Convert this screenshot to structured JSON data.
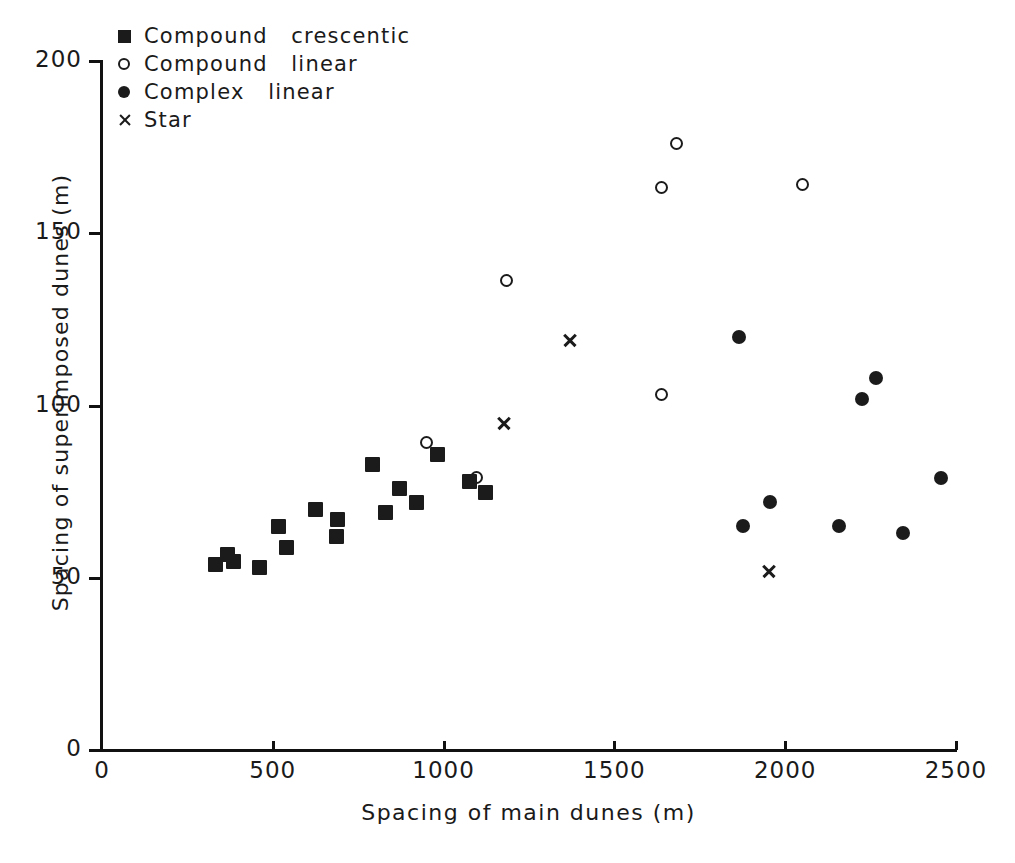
{
  "chart_data": {
    "type": "scatter",
    "title": "",
    "xlabel": "Spacing  of  main  dunes  (m)",
    "ylabel": "Spacing  of  superimposed  dunes  (m)",
    "xlim": [
      0,
      2500
    ],
    "ylim": [
      0,
      200
    ],
    "xticks": [
      0,
      500,
      1000,
      1500,
      2000,
      2500
    ],
    "yticks": [
      0,
      50,
      100,
      150,
      200
    ],
    "xtick_labels": [
      "0",
      "500",
      "1000",
      "1500",
      "2000",
      "2500"
    ],
    "ytick_labels": [
      "0",
      "50",
      "100",
      "150",
      "200"
    ],
    "grid": false,
    "legend_position": "top-left",
    "series": [
      {
        "name": "Compound  crescentic",
        "marker": "filled-square",
        "color": "#1b1b1b",
        "points": [
          [
            331,
            54
          ],
          [
            366,
            57
          ],
          [
            384,
            55
          ],
          [
            460,
            53
          ],
          [
            516,
            65
          ],
          [
            539,
            59
          ],
          [
            624,
            70
          ],
          [
            686,
            62
          ],
          [
            689,
            67
          ],
          [
            791,
            83
          ],
          [
            829,
            69
          ],
          [
            868,
            76
          ],
          [
            920,
            72
          ],
          [
            982,
            86
          ],
          [
            1075,
            78
          ],
          [
            1122,
            75
          ]
        ]
      },
      {
        "name": "Compound  linear",
        "marker": "open-circle",
        "color": "#1b1b1b",
        "points": [
          [
            952,
            89
          ],
          [
            1099,
            79
          ],
          [
            1187,
            136
          ],
          [
            1638,
            163
          ],
          [
            1638,
            103
          ],
          [
            1682,
            176
          ],
          [
            2052,
            164
          ]
        ]
      },
      {
        "name": "Complex  linear",
        "marker": "filled-circle",
        "color": "#1b1b1b",
        "points": [
          [
            1864,
            120
          ],
          [
            1876,
            65
          ],
          [
            1955,
            72
          ],
          [
            2157,
            65
          ],
          [
            2224,
            102
          ],
          [
            2267,
            108
          ],
          [
            2344,
            63
          ],
          [
            2456,
            79
          ]
        ]
      },
      {
        "name": "Star",
        "marker": "x",
        "color": "#1b1b1b",
        "points": [
          [
            1178,
            95
          ],
          [
            1370,
            119
          ],
          [
            1952,
            52
          ]
        ]
      }
    ]
  },
  "legend": {
    "items": [
      {
        "label": "Compound   crescentic",
        "marker": "filled-square"
      },
      {
        "label": "Compound   linear",
        "marker": "open-circle"
      },
      {
        "label": "Complex   linear",
        "marker": "filled-circle"
      },
      {
        "label": "Star",
        "marker": "x"
      }
    ]
  },
  "axes": {
    "x_title": "Spacing   of   main   dunes   (m)",
    "y_title": "Spacing  of  superimposed  dunes  (m)"
  },
  "colors": {
    "ink": "#1b1b1b",
    "background": "#ffffff"
  }
}
